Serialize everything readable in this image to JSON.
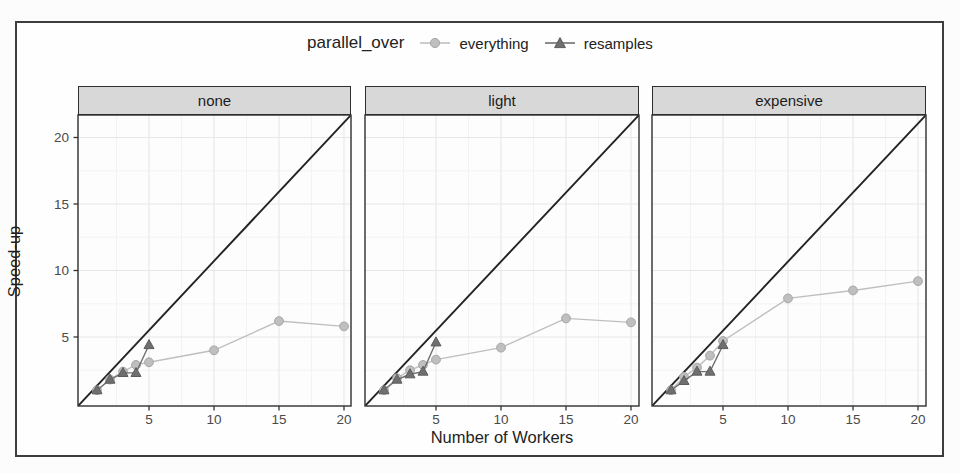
{
  "figure": {
    "legend": {
      "title": "parallel_over",
      "items": [
        {
          "label": "everything",
          "marker": "circle",
          "color": "#bfbfbf",
          "stroke": "#a6a6a6"
        },
        {
          "label": "resamples",
          "marker": "triangle",
          "color": "#6f6f6f",
          "stroke": "#5c5c5c"
        }
      ]
    }
  },
  "chart_data": {
    "type": "line",
    "title": "",
    "xlabel": "Number of Workers",
    "ylabel": "Speed-up",
    "facets": [
      "none",
      "light",
      "expensive"
    ],
    "x_ticks": [
      5,
      10,
      15,
      20
    ],
    "y_ticks": [
      5,
      10,
      15,
      20
    ],
    "xlim": [
      0,
      21.5
    ],
    "ylim": [
      0,
      21.7
    ],
    "grid": "major-and-faint-minor",
    "legend_position": "top",
    "reference_line": {
      "type": "identity",
      "label": "y = x",
      "color": "#222222"
    },
    "series": [
      {
        "name": "everything",
        "facet": "none",
        "x": [
          1,
          2,
          3,
          4,
          5,
          10,
          15,
          20
        ],
        "y": [
          1.0,
          1.8,
          2.4,
          2.9,
          3.1,
          4.0,
          6.2,
          5.8
        ]
      },
      {
        "name": "resamples",
        "facet": "none",
        "x": [
          1,
          2,
          3,
          4,
          5
        ],
        "y": [
          1.0,
          1.8,
          2.3,
          2.3,
          4.4
        ]
      },
      {
        "name": "everything",
        "facet": "light",
        "x": [
          1,
          2,
          3,
          4,
          5,
          10,
          15,
          20
        ],
        "y": [
          1.0,
          1.9,
          2.5,
          2.9,
          3.3,
          4.2,
          6.4,
          6.1
        ]
      },
      {
        "name": "resamples",
        "facet": "light",
        "x": [
          1,
          2,
          3,
          4,
          5
        ],
        "y": [
          1.0,
          1.8,
          2.2,
          2.4,
          4.6
        ]
      },
      {
        "name": "everything",
        "facet": "expensive",
        "x": [
          1,
          2,
          3,
          4,
          5,
          10,
          15,
          20
        ],
        "y": [
          1.0,
          2.0,
          2.7,
          3.6,
          4.7,
          7.9,
          8.5,
          9.2
        ]
      },
      {
        "name": "resamples",
        "facet": "expensive",
        "x": [
          1,
          2,
          3,
          4,
          5
        ],
        "y": [
          1.0,
          1.7,
          2.4,
          2.4,
          4.4
        ]
      }
    ]
  },
  "colors": {
    "frame_border": "#3d3d3d",
    "panel_bg": "#fdfdfd",
    "panel_border": "#2e2e2e",
    "strip_bg": "#d8d8d8",
    "grid_major": "#e7e7e7",
    "grid_minor": "#f3f3f3",
    "tick_mark": "#333333",
    "tick_label": "#4a4a4a",
    "identity_line": "#222222"
  }
}
